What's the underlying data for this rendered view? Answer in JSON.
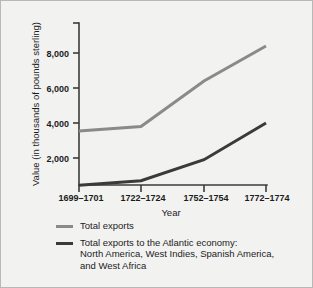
{
  "chart_data": {
    "type": "line",
    "title": "",
    "xlabel": "Year",
    "ylabel": "Value (in thousands of pounds sterling)",
    "categories": [
      "1699–1701",
      "1722–1724",
      "1752–1754",
      "1772–1774"
    ],
    "yticks": [
      "2,000",
      "4,000",
      "6,000",
      "8,000"
    ],
    "ytick_values": [
      2000,
      4000,
      6000,
      8000
    ],
    "ylim": [
      0,
      9000
    ],
    "grid": false,
    "legend_position": "below-plot",
    "series": [
      {
        "name": "Total exports",
        "color": "#8a8a8a",
        "values": [
          3550,
          3800,
          6400,
          8400
        ]
      },
      {
        "name": "Total exports to the Atlantic economy:\nNorth America, West Indies, Spanish America,\nand West Africa",
        "color": "#3a3a3a",
        "values": [
          450,
          700,
          1900,
          4000
        ]
      }
    ]
  },
  "axis": {
    "axis_color": "#3b3b3b",
    "background": "#f2f2f1",
    "border_color": "#b8b8b6"
  }
}
